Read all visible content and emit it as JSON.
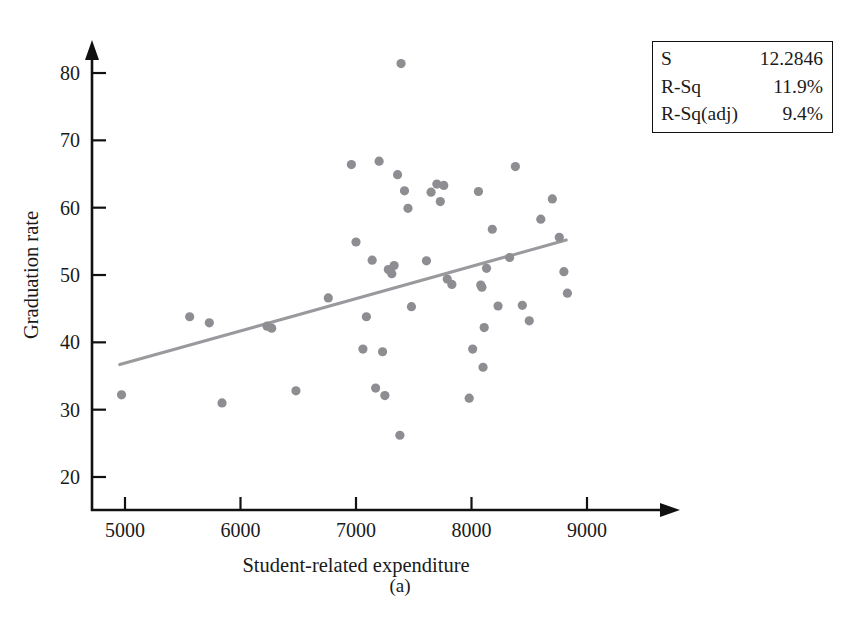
{
  "figure": {
    "caption": "(a)",
    "background": "#ffffff"
  },
  "stats_box": {
    "rows": [
      {
        "label": "S",
        "value": "12.2846"
      },
      {
        "label": "R-Sq",
        "value": "11.9%"
      },
      {
        "label": "R-Sq(adj)",
        "value": "9.4%"
      }
    ]
  },
  "chart_data": {
    "type": "scatter",
    "title": "",
    "xlabel": "Student-related expenditure",
    "ylabel": "Graduation rate",
    "xlim": [
      4700,
      9150
    ],
    "ylim": [
      17,
      84
    ],
    "xticks": [
      5000,
      6000,
      7000,
      8000,
      9000
    ],
    "xtick_labels": [
      "5000",
      "6000",
      "7000",
      "8000",
      "9000"
    ],
    "yticks": [
      20,
      30,
      40,
      50,
      60,
      70,
      80
    ],
    "ytick_labels": [
      "20",
      "30",
      "40",
      "50",
      "60",
      "70",
      "80"
    ],
    "grid": false,
    "legend_position": "top-right",
    "point_color": "#8d8d92",
    "point_radius": 4.6,
    "line_color": "#9a9a9e",
    "axis_color": "#111111",
    "x": [
      4970,
      5560,
      5730,
      5840,
      6230,
      6270,
      6480,
      6760,
      6960,
      7000,
      7060,
      7090,
      7140,
      7170,
      7200,
      7230,
      7250,
      7280,
      7310,
      7330,
      7360,
      7380,
      7390,
      7420,
      7450,
      7480,
      7610,
      7650,
      7700,
      7730,
      7760,
      7790,
      7830,
      7980,
      8010,
      8060,
      8080,
      8090,
      8100,
      8110,
      8130,
      8180,
      8230,
      8330,
      8380,
      8440,
      8500,
      8600,
      8700,
      8760,
      8800,
      8830
    ],
    "y": [
      32.2,
      43.8,
      42.9,
      31.0,
      42.4,
      42.1,
      32.8,
      46.6,
      66.4,
      54.9,
      39.0,
      43.8,
      52.2,
      33.2,
      66.9,
      38.6,
      32.1,
      50.8,
      50.2,
      51.4,
      64.9,
      26.2,
      81.4,
      62.5,
      59.9,
      45.3,
      52.1,
      62.3,
      63.5,
      60.9,
      63.3,
      49.4,
      48.6,
      31.7,
      39.0,
      62.4,
      48.5,
      48.2,
      36.3,
      42.2,
      51.0,
      56.8,
      45.4,
      52.6,
      66.1,
      45.5,
      43.2,
      58.3,
      61.3,
      55.6,
      50.5,
      47.3
    ],
    "fit_line": {
      "name": "regression line",
      "x_start": 4955,
      "y_start": 36.7,
      "x_end": 8820,
      "y_end": 55.2
    }
  }
}
